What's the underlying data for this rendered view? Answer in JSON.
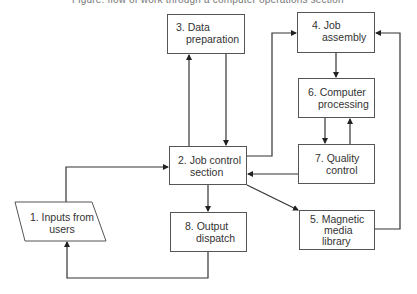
{
  "caption": "Figure: flow of work through a computer operations section",
  "nodes": {
    "n1": {
      "line1": "1. Inputs from",
      "line2": "users",
      "shape": "parallelogram"
    },
    "n2": {
      "line1": "2. Job control",
      "line2": "section",
      "shape": "box"
    },
    "n3": {
      "line1": "3. Data",
      "line2": "preparation",
      "shape": "box"
    },
    "n4": {
      "line1": "4. Job",
      "line2": "assembly",
      "shape": "box"
    },
    "n5": {
      "line1": "5. Magnetic",
      "line2": "media",
      "line3": "library",
      "shape": "box"
    },
    "n6": {
      "line1": "6. Computer",
      "line2": "processing",
      "shape": "box"
    },
    "n7": {
      "line1": "7. Quality",
      "line2": "control",
      "shape": "box"
    },
    "n8": {
      "line1": "8. Output",
      "line2": "dispatch",
      "shape": "box"
    }
  },
  "edges": [
    {
      "from": "1. Inputs from users",
      "to": "2. Job control section"
    },
    {
      "from": "2. Job control section",
      "to": "3. Data preparation"
    },
    {
      "from": "3. Data preparation",
      "to": "2. Job control section"
    },
    {
      "from": "2. Job control section",
      "to": "4. Job assembly"
    },
    {
      "from": "4. Job assembly",
      "to": "6. Computer processing"
    },
    {
      "from": "6. Computer processing",
      "to": "7. Quality control"
    },
    {
      "from": "7. Quality control",
      "to": "6. Computer processing"
    },
    {
      "from": "7. Quality control",
      "to": "2. Job control section"
    },
    {
      "from": "2. Job control section",
      "to": "5. Magnetic media library"
    },
    {
      "from": "5. Magnetic media library",
      "to": "4. Job assembly"
    },
    {
      "from": "2. Job control section",
      "to": "8. Output dispatch"
    },
    {
      "from": "8. Output dispatch",
      "to": "1. Inputs from users"
    }
  ],
  "colors": {
    "line": "#333333",
    "border": "#555555",
    "text": "#333333"
  }
}
